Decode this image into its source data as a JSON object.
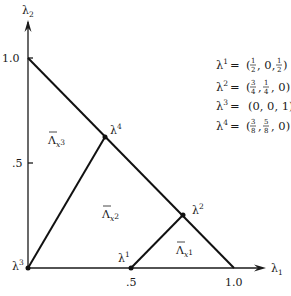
{
  "axes": {
    "x_label": "λ",
    "x_label_sub": "1",
    "y_label": "λ",
    "y_label_sub": "2",
    "x_ticks": [
      ".5",
      "1.0"
    ],
    "y_ticks": [
      ".5",
      "1.0"
    ]
  },
  "vertices": {
    "l1": {
      "label": "λ",
      "sup": "1",
      "coords": [
        0.5,
        0
      ]
    },
    "l2": {
      "label": "λ",
      "sup": "2",
      "coords": [
        0.75,
        0.25
      ]
    },
    "l3": {
      "label": "λ",
      "sup": "3",
      "coords": [
        0,
        0
      ]
    },
    "l4": {
      "label": "λ",
      "sup": "4",
      "coords": [
        0.375,
        0.625
      ]
    }
  },
  "regions": {
    "r1": {
      "label": "Λ",
      "sub": "x",
      "subsup": "1"
    },
    "r2": {
      "label": "Λ",
      "sub": "x",
      "subsup": "2"
    },
    "r3": {
      "label": "Λ",
      "sub": "x",
      "subsup": "3"
    }
  },
  "legend": [
    {
      "lhs": "λ",
      "sup": "1",
      "rhs": "(1/2 , 0, 1/2)",
      "parts": [
        "(",
        "1",
        "2",
        ", 0, ",
        "1",
        "2",
        ")"
      ]
    },
    {
      "lhs": "λ",
      "sup": "2",
      "rhs": "(3/4 , 1/4 , 0)",
      "parts": [
        "(",
        "3",
        "4",
        " , ",
        "1",
        "4",
        " , 0)"
      ]
    },
    {
      "lhs": "λ",
      "sup": "3",
      "rhs": "(0, 0, 1)"
    },
    {
      "lhs": "λ",
      "sup": "4",
      "rhs": "(3/8 , 5/8 , 0)",
      "parts": [
        "(",
        "3",
        "8",
        " , ",
        "5",
        "8",
        " , 0)"
      ]
    }
  ],
  "equals": "="
}
